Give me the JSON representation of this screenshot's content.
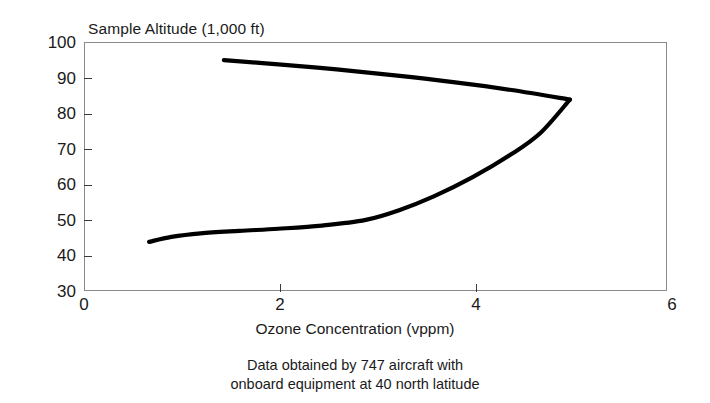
{
  "chart_data": {
    "type": "line",
    "title": "Sample Altitude (1,000 ft)",
    "xlabel": "Ozone Concentration (vppm)",
    "ylabel": "Sample Altitude (1,000 ft)",
    "caption_line1": "Data obtained by 747 aircraft with",
    "caption_line2": "onboard equipment at 40 north latitude",
    "xlim": [
      0,
      6
    ],
    "ylim": [
      30,
      100
    ],
    "xticks": [
      0,
      2,
      4,
      6
    ],
    "xtick_labels": [
      "0",
      "2",
      "4",
      "6"
    ],
    "yticks": [
      30,
      40,
      50,
      60,
      70,
      80,
      90,
      100
    ],
    "ytick_labels": [
      "100",
      "90",
      "80",
      "70",
      "60",
      "50",
      "40",
      "30"
    ],
    "grid": false,
    "legend": "none",
    "line_color": "#000000",
    "frame_color": "#8a8a8a",
    "series": [
      {
        "name": "Upper branch (descending from stratosphere)",
        "x": [
          1.44,
          2.0,
          2.6,
          3.2,
          3.8,
          4.4,
          5.0
        ],
        "y": [
          94.9,
          93.7,
          92.3,
          90.6,
          88.7,
          86.5,
          83.8
        ]
      },
      {
        "name": "Lower branch (ascending profile)",
        "x": [
          0.67,
          0.9,
          1.2,
          1.6,
          2.0,
          2.45,
          2.9,
          3.25,
          3.6,
          4.0,
          4.4,
          4.7,
          5.0
        ],
        "y": [
          43.8,
          45.2,
          46.2,
          46.9,
          47.5,
          48.4,
          50.0,
          52.8,
          56.6,
          62.0,
          68.5,
          74.5,
          83.8
        ]
      }
    ],
    "annotations": []
  }
}
